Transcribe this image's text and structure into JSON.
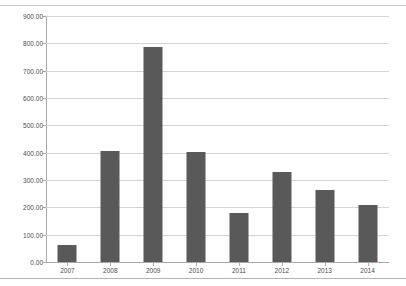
{
  "chart_data": {
    "type": "bar",
    "title": "",
    "xlabel": "",
    "ylabel": "",
    "categories": [
      "2007",
      "2008",
      "2009",
      "2010",
      "2011",
      "2012",
      "2013",
      "2014"
    ],
    "values": [
      62,
      405,
      785,
      403,
      180,
      328,
      265,
      208
    ],
    "series": [
      {
        "name": "",
        "values": [
          62,
          405,
          785,
          403,
          180,
          328,
          265,
          208
        ]
      }
    ],
    "ylim": [
      0,
      900
    ],
    "ytick_values": [
      0,
      100,
      200,
      300,
      400,
      500,
      600,
      700,
      800,
      900
    ],
    "ytick_labels": [
      "0.00",
      "100.00",
      "200.00",
      "300.00",
      "400.00",
      "500.00",
      "600.00",
      "700.00",
      "800.00",
      "900.00"
    ],
    "grid": "horizontal",
    "legend": "none",
    "bar_color": "#595959",
    "gridline_color": "#d4d4d4",
    "axis_color": "#a8a8a8",
    "plot_background": "#ffffff"
  }
}
